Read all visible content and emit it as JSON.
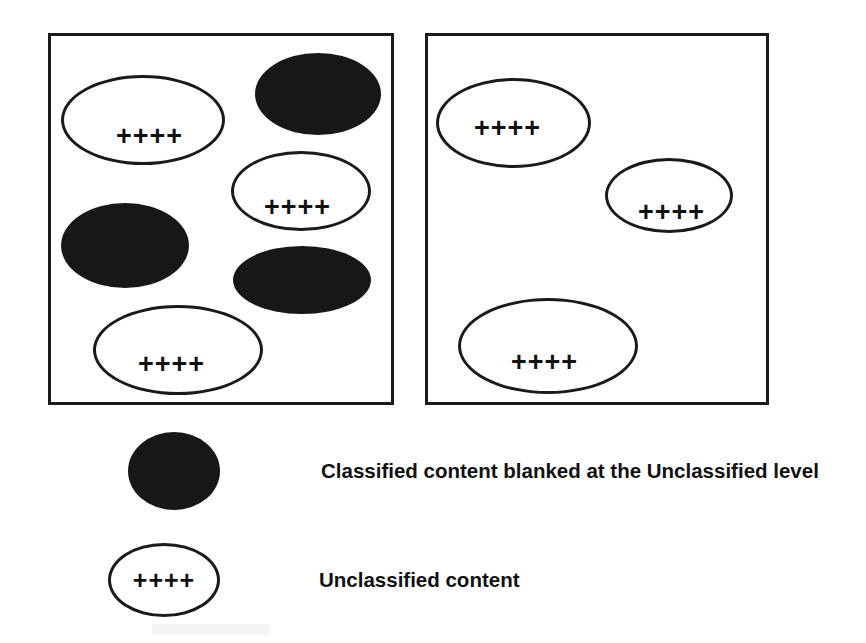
{
  "figure": {
    "type": "diagram",
    "background_color": "#ffffff",
    "ink_color": "#1a1a1a",
    "blanked_fill_color": "#171717",
    "plus_token": "++++"
  },
  "panels": [
    {
      "id": "panel-left",
      "name": "left-panel",
      "shapes": [
        {
          "id": "l-open-1",
          "kind": "open",
          "label": "++++",
          "x": 10,
          "y": 39,
          "w": 164,
          "h": 90,
          "label_dx": 52,
          "label_dy": 45
        },
        {
          "id": "l-blanked-1",
          "kind": "blanked",
          "label": "",
          "x": 204,
          "y": 17,
          "w": 126,
          "h": 82,
          "label_dx": 0,
          "label_dy": 0
        },
        {
          "id": "l-open-2",
          "kind": "open",
          "label": "++++",
          "x": 180,
          "y": 115,
          "w": 140,
          "h": 80,
          "label_dx": 30,
          "label_dy": 40
        },
        {
          "id": "l-blanked-2",
          "kind": "blanked",
          "label": "",
          "x": 10,
          "y": 167,
          "w": 128,
          "h": 85,
          "label_dx": 0,
          "label_dy": 0
        },
        {
          "id": "l-blanked-3",
          "kind": "blanked",
          "label": "",
          "x": 182,
          "y": 210,
          "w": 138,
          "h": 68,
          "label_dx": 0,
          "label_dy": 0
        },
        {
          "id": "l-open-3",
          "kind": "open",
          "label": "++++",
          "x": 42,
          "y": 269,
          "w": 170,
          "h": 90,
          "label_dx": 42,
          "label_dy": 43
        }
      ]
    },
    {
      "id": "panel-right",
      "name": "right-panel",
      "shapes": [
        {
          "id": "r-open-1",
          "kind": "open",
          "label": "++++",
          "x": 8,
          "y": 42,
          "w": 155,
          "h": 90,
          "label_dx": 35,
          "label_dy": 34
        },
        {
          "id": "r-open-2",
          "kind": "open",
          "label": "++++",
          "x": 177,
          "y": 122,
          "w": 128,
          "h": 75,
          "label_dx": 30,
          "label_dy": 38
        },
        {
          "id": "r-open-3",
          "kind": "open",
          "label": "++++",
          "x": 30,
          "y": 262,
          "w": 180,
          "h": 96,
          "label_dx": 50,
          "label_dy": 48
        }
      ]
    }
  ],
  "legend": {
    "items": [
      {
        "id": "legend-classified",
        "swatch": "blanked-ellipse",
        "swatch_label": "",
        "text": "Classified content blanked at the Unclassified level"
      },
      {
        "id": "legend-unclassified",
        "swatch": "open-ellipse",
        "swatch_label": "++++",
        "text": "Unclassified content"
      }
    ]
  }
}
